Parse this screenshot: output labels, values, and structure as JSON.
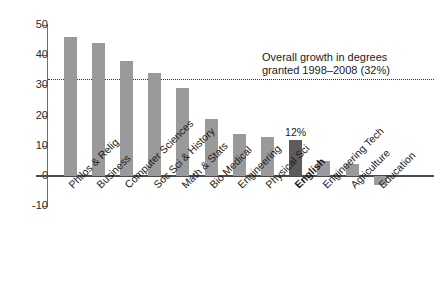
{
  "chart_data": {
    "type": "bar",
    "title": "",
    "subtitle": "",
    "xlabel": "",
    "ylabel": "",
    "ylim": [
      -10,
      50
    ],
    "yticks": [
      50,
      40,
      30,
      20,
      10,
      0,
      -10
    ],
    "grid": false,
    "legend": "none",
    "categories": [
      "Philos & Relig",
      "Business",
      "Computer Sciences",
      "Soc Sci & History",
      "Math & Stats",
      "Bio Medical",
      "Engineering",
      "Physical Sci",
      "English",
      "Engineering Tech",
      "Agriculture",
      "Education"
    ],
    "values": [
      46,
      44,
      38,
      34,
      29,
      19,
      14,
      13,
      12,
      5,
      4,
      -3
    ],
    "highlight_index": 8,
    "data_labels": [
      null,
      null,
      null,
      null,
      null,
      null,
      null,
      null,
      "12%",
      null,
      null,
      null
    ],
    "reference_line": {
      "value": 32,
      "style": "dotted",
      "label_line1": "Overall growth in degrees",
      "label_line2": "granted 1998–2008 (32%)"
    },
    "colors": {
      "bar": "#9a9a9a",
      "highlight_bar": "#5c5c5c",
      "axis": "#4a4a4a",
      "text": "#1a1a1a",
      "reference_line": "#333333"
    }
  },
  "axis": {
    "tick_labels": [
      "50",
      "40",
      "30",
      "20",
      "10",
      "0",
      "-10"
    ]
  },
  "annotation": {
    "line1": "Overall growth in degrees",
    "line2": "granted 1998–2008 (32%)"
  },
  "bar_value_labels": {
    "english": "12%"
  }
}
